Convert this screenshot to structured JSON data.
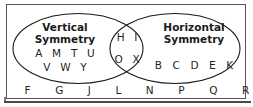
{
  "figure": {
    "type": "venn-diagram",
    "sets": [
      {
        "id": "vertical",
        "title": "Vertical\nSymmetry",
        "title_line_1": "Vertical",
        "title_line_2": "Symmetry",
        "members_row_1": "A M T U",
        "members_row_2": "V W Y"
      },
      {
        "id": "horizontal",
        "title_line_1": "Horizontal",
        "title_line_2": "Symmetry",
        "members_row_1": "B C D E K"
      }
    ],
    "intersection": {
      "members_row_1": "H I",
      "members_row_2": "O X"
    },
    "outside": {
      "members": "F G J L N P Q R S Z"
    },
    "colors": {
      "stroke": "#1a1a1a",
      "border": "#555555",
      "text": "#1f1f1f",
      "background": "#ffffff"
    }
  }
}
